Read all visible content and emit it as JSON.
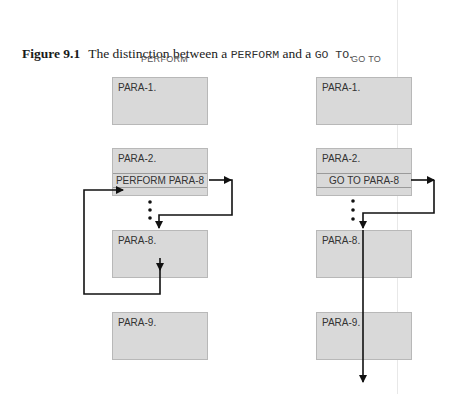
{
  "caption": {
    "figure_label": "Figure 9.1",
    "text_before": "The distinction between a ",
    "code1": "PERFORM",
    "text_middle": " and a ",
    "code2": "GO TO",
    "text_after": "."
  },
  "columns": [
    {
      "label": "PERFORM",
      "boxes": [
        "PARA-1.",
        "PARA-2.",
        "PARA-8.",
        "PARA-9."
      ],
      "statement": "PERFORM PARA-8"
    },
    {
      "label": "GO TO",
      "boxes": [
        "PARA-1.",
        "PARA-2.",
        "PARA-8.",
        "PARA-9."
      ],
      "statement": "GO TO PARA-8"
    }
  ],
  "colors": {
    "box_fill": "#d9d9d9",
    "arrow": "#111111"
  }
}
